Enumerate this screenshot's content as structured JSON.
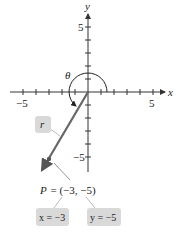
{
  "diagram": {
    "type": "coordinate-plane",
    "axes": {
      "x_label": "x",
      "y_label": "y",
      "x_ticks": {
        "neg_label": "−5",
        "pos_label": "5"
      },
      "y_ticks": {
        "pos_label": "5",
        "neg_label": "−5"
      },
      "range": [
        -5,
        5
      ]
    },
    "angle_label": "θ",
    "radius_label": "r",
    "point": {
      "name": "P",
      "x": -3,
      "y": -5,
      "label": "P = (−3, −5)"
    },
    "callouts": {
      "x_value": "x = −3",
      "y_value": "y = −5"
    },
    "colors": {
      "axis": "#333333",
      "ray": "#666666",
      "callout_bg": "#d9d9d9",
      "text": "#222222"
    }
  }
}
